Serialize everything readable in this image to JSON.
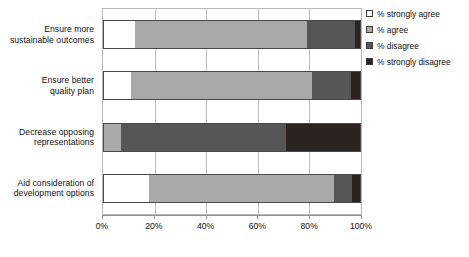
{
  "chart_data": {
    "type": "bar",
    "subtype": "stacked-horizontal-100pct",
    "title": "",
    "xlabel": "",
    "ylabel": "",
    "xlim": [
      0,
      100
    ],
    "xticks": [
      0,
      20,
      40,
      60,
      80,
      100
    ],
    "xticklabels": [
      "0%",
      "20%",
      "40%",
      "60%",
      "80%",
      "100%"
    ],
    "grid": true,
    "grid_axis": "x",
    "legend_position": "right",
    "orientation": "horizontal",
    "categories": [
      "Ensure more sustainable outcomes",
      "Ensure better quality plan",
      "Decrease opposing representations",
      "Aid consideration of development options"
    ],
    "category_lines": [
      [
        "Ensure more",
        "sustainable outcomes"
      ],
      [
        "Ensure better",
        "quality plan"
      ],
      [
        "Decrease opposing",
        "representations"
      ],
      [
        "Aid consideration of",
        "development options"
      ]
    ],
    "series": [
      {
        "name": "% strongly agree",
        "color": "#ffffff",
        "values": [
          12.5,
          11.0,
          0.0,
          18.0
        ]
      },
      {
        "name": "% agree",
        "color": "#a9a9a9",
        "values": [
          66.5,
          70.0,
          7.0,
          71.5
        ]
      },
      {
        "name": "% disagree",
        "color": "#555555",
        "values": [
          18.7,
          15.0,
          64.0,
          7.0
        ]
      },
      {
        "name": "% strongly disagree",
        "color": "#2b2320",
        "values": [
          2.3,
          4.0,
          29.0,
          3.5
        ]
      }
    ]
  },
  "legend": {
    "items": [
      {
        "label": "% strongly agree",
        "color": "#ffffff"
      },
      {
        "label": "% agree",
        "color": "#a9a9a9"
      },
      {
        "label": "% disagree",
        "color": "#555555"
      },
      {
        "label": "% strongly disagree",
        "color": "#2b2320"
      }
    ]
  }
}
